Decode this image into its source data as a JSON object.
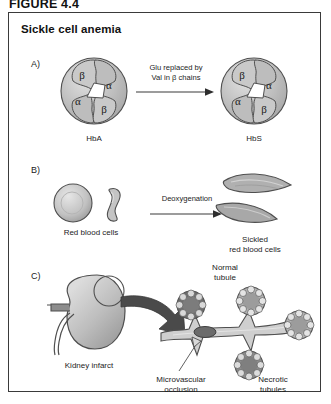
{
  "figure": {
    "caption": "FIGURE 4.4",
    "title": "Sickle cell anemia"
  },
  "panels": [
    {
      "letter": "A)",
      "left_label": "HbA",
      "right_label": "HbS",
      "arrow_text_line1": "Glu replaced by",
      "arrow_text_line2": "Val in β chains",
      "subunits": [
        "β",
        "α",
        "α",
        "β"
      ]
    },
    {
      "letter": "B)",
      "left_label": "Red blood cells",
      "right_label_line1": "Sickled",
      "right_label_line2": "red blood cells",
      "arrow_text_line1": "Deoxygenation"
    },
    {
      "letter": "C)",
      "kidney_label": "Kidney infarct",
      "normal_tubule_line1": "Normal",
      "normal_tubule_line2": "tubule",
      "occlusion_line1": "Microvascular",
      "occlusion_line2": "occlusion",
      "necrotic_line1": "Necrotic",
      "necrotic_line2": "tubules"
    }
  ],
  "icons": {
    "hemoglobin": "hemoglobin-tetramer-icon",
    "rbc_round": "red-blood-cell-round-icon",
    "rbc_edge": "red-blood-cell-edge-icon",
    "sickle_cell": "sickled-cell-icon",
    "kidney": "kidney-icon",
    "magnifier": "magnification-circle-icon",
    "zoom_arrow": "zoom-arrow-icon",
    "tubule": "renal-tubule-icon",
    "reaction_arrow": "reaction-arrow-icon"
  },
  "colors": {
    "border": "#3a3a3a",
    "fill_light": "#d6d6d6",
    "fill_mid": "#b9b9b9",
    "fill_dark": "#8f8f8f",
    "fill_darker": "#6e6e6e",
    "arrow_dark": "#4a4a4a",
    "outline": "#4f4f4f"
  }
}
